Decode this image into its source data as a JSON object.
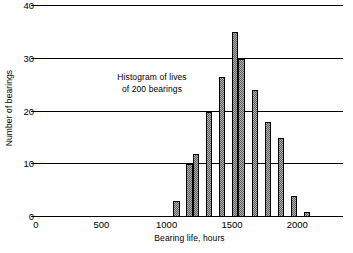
{
  "chart_data": {
    "type": "bar",
    "title": "",
    "xlabel": "Bearing life, hours",
    "ylabel": "Number of bearings",
    "xlim": [
      0,
      2350
    ],
    "ylim": [
      0,
      40
    ],
    "grid": true,
    "legend": null,
    "bin_width": 50,
    "x_ticks": [
      {
        "value": 0,
        "label": "0"
      },
      {
        "value": 500,
        "label": "500"
      },
      {
        "value": 1000,
        "label": "1000"
      },
      {
        "value": 1500,
        "label": "1500"
      },
      {
        "value": 2000,
        "label": "2000"
      }
    ],
    "y_ticks": [
      {
        "value": 0,
        "label": "0"
      },
      {
        "value": 10,
        "label": "10"
      },
      {
        "value": 20,
        "label": "20"
      },
      {
        "value": 30,
        "label": "30"
      },
      {
        "value": 40,
        "label": "40"
      }
    ],
    "bin_starts": [
      1050,
      1150,
      1200,
      1300,
      1400,
      1500,
      1550,
      1650,
      1750,
      1850,
      1950,
      2050
    ],
    "categories": [
      "1050",
      "1150",
      "1200",
      "1300",
      "1400",
      "1500",
      "1550",
      "1650",
      "1750",
      "1850",
      "1950",
      "2050"
    ],
    "values": [
      3,
      10,
      12,
      20,
      26.5,
      35,
      30,
      24,
      18,
      15,
      4,
      1
    ],
    "bars": [
      {
        "x_start": 1050,
        "x_end": 1100,
        "value": 3
      },
      {
        "x_start": 1150,
        "x_end": 1200,
        "value": 10
      },
      {
        "x_start": 1200,
        "x_end": 1250,
        "value": 12
      },
      {
        "x_start": 1300,
        "x_end": 1350,
        "value": 20
      },
      {
        "x_start": 1400,
        "x_end": 1450,
        "value": 26.5
      },
      {
        "x_start": 1500,
        "x_end": 1550,
        "value": 35
      },
      {
        "x_start": 1550,
        "x_end": 1600,
        "value": 30
      },
      {
        "x_start": 1650,
        "x_end": 1700,
        "value": 24
      },
      {
        "x_start": 1750,
        "x_end": 1800,
        "value": 18
      },
      {
        "x_start": 1850,
        "x_end": 1900,
        "value": 15
      },
      {
        "x_start": 1950,
        "x_end": 2000,
        "value": 4
      },
      {
        "x_start": 2050,
        "x_end": 2100,
        "value": 1
      }
    ],
    "annotations": [
      {
        "line1": "Histogram of lives",
        "line2": "of 200 bearings"
      }
    ],
    "colors": {
      "bar_fill": "#b3b3b3",
      "bar_hatch": "#5d5d5d",
      "bar_edge": "#000000",
      "axis": "#000000",
      "background": "#ffffff"
    }
  },
  "annotation": {
    "line1": "Histogram of lives",
    "line2": "of 200 bearings"
  }
}
